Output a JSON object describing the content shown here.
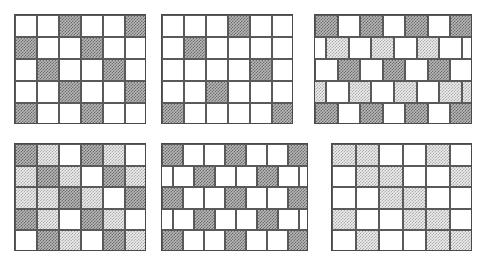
{
  "figure": {
    "title": "",
    "background_color": "#ffffff",
    "width": 486,
    "height": 259,
    "panel_count": 6
  },
  "palette": {
    "white": "#ffffff",
    "light_hatch": "#ececec",
    "mid_hatch": "#d2d2d2",
    "dark_hatch": "#b7b7b7",
    "cell_border": "#5a5a5a",
    "panel_border": "#4a4a4a"
  },
  "legend": {
    "0": "white",
    "1": "dark",
    "2": "light",
    "3": "mid"
  },
  "chart_data": {
    "type": "heatmap",
    "title": "",
    "xlabel": "",
    "ylabel": "",
    "grid": true,
    "legend_position": "none",
    "panels": [
      {
        "name": "panel-top-left",
        "label": "",
        "columns": 6,
        "rows": 5,
        "offset_rows": false,
        "x": 14,
        "y": 14,
        "width": 132,
        "height": 110,
        "cells": [
          [
            0,
            0,
            1,
            0,
            0,
            1
          ],
          [
            1,
            0,
            0,
            1,
            0,
            0
          ],
          [
            0,
            1,
            0,
            0,
            1,
            0
          ],
          [
            0,
            0,
            1,
            0,
            0,
            1
          ],
          [
            1,
            0,
            0,
            1,
            0,
            0
          ]
        ]
      },
      {
        "name": "panel-top-center",
        "label": "",
        "columns": 6,
        "rows": 5,
        "offset_rows": false,
        "x": 161,
        "y": 14,
        "width": 132,
        "height": 110,
        "cells": [
          [
            0,
            0,
            0,
            1,
            0,
            0
          ],
          [
            0,
            1,
            0,
            0,
            0,
            0
          ],
          [
            0,
            0,
            0,
            0,
            1,
            0
          ],
          [
            0,
            0,
            1,
            0,
            0,
            0
          ],
          [
            1,
            0,
            0,
            0,
            0,
            1
          ]
        ]
      },
      {
        "name": "panel-top-right",
        "label": "",
        "columns": 7,
        "rows": 5,
        "offset_rows": true,
        "x": 314,
        "y": 14,
        "width": 158,
        "height": 110,
        "cells": [
          [
            1,
            0,
            1,
            0,
            1,
            0,
            1
          ],
          [
            0,
            2,
            0,
            2,
            0,
            2,
            0
          ],
          [
            0,
            1,
            0,
            1,
            0,
            1,
            0
          ],
          [
            2,
            0,
            2,
            0,
            2,
            0,
            2
          ],
          [
            1,
            0,
            1,
            0,
            1,
            0,
            1
          ]
        ]
      },
      {
        "name": "panel-bottom-left",
        "label": "",
        "columns": 6,
        "rows": 5,
        "offset_rows": false,
        "x": 14,
        "y": 143,
        "width": 132,
        "height": 108,
        "cells": [
          [
            1,
            2,
            0,
            1,
            2,
            0
          ],
          [
            2,
            1,
            2,
            0,
            1,
            2
          ],
          [
            2,
            2,
            1,
            2,
            0,
            1
          ],
          [
            1,
            2,
            0,
            1,
            2,
            0
          ],
          [
            0,
            1,
            2,
            0,
            1,
            2
          ]
        ]
      },
      {
        "name": "panel-bottom-center",
        "label": "",
        "columns": 7,
        "rows": 5,
        "offset_rows": true,
        "x": 161,
        "y": 143,
        "width": 147,
        "height": 108,
        "cells": [
          [
            1,
            0,
            0,
            1,
            0,
            0,
            1
          ],
          [
            0,
            0,
            1,
            0,
            0,
            1,
            0
          ],
          [
            1,
            0,
            0,
            1,
            0,
            0,
            1
          ],
          [
            0,
            0,
            1,
            0,
            0,
            1,
            0
          ],
          [
            1,
            0,
            0,
            1,
            0,
            0,
            1
          ]
        ]
      },
      {
        "name": "panel-bottom-right",
        "label": "",
        "columns": 6,
        "rows": 5,
        "offset_rows": false,
        "x": 331,
        "y": 143,
        "width": 141,
        "height": 108,
        "cells": [
          [
            2,
            2,
            0,
            0,
            2,
            0
          ],
          [
            0,
            2,
            2,
            0,
            0,
            2
          ],
          [
            0,
            0,
            2,
            2,
            0,
            0
          ],
          [
            2,
            0,
            0,
            2,
            2,
            0
          ],
          [
            0,
            2,
            0,
            0,
            2,
            2
          ]
        ]
      }
    ]
  }
}
